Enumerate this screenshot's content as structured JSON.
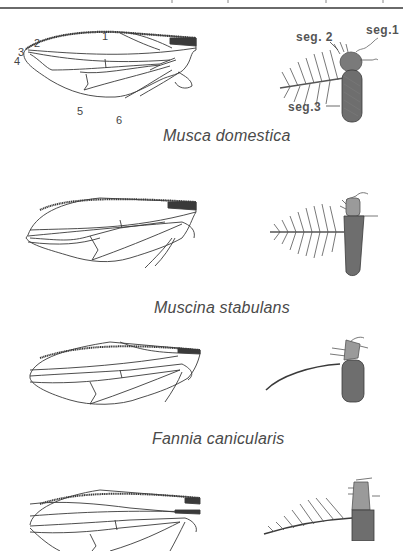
{
  "header": {
    "rule_color": "#6a6a6a"
  },
  "figures": [
    {
      "species": "Musca domestica",
      "wing_labels": [
        "1",
        "2",
        "3",
        "4",
        "5",
        "6"
      ],
      "antenna_labels": {
        "seg1": "seg.1",
        "seg2": "seg. 2",
        "seg3": "seg.3"
      },
      "arista_type": "plumose (feathered both sides)"
    },
    {
      "species": "Muscina stabulans",
      "arista_type": "plumose (feathered both sides)"
    },
    {
      "species": "Fannia canicularis",
      "arista_type": "bare"
    },
    {
      "species": "",
      "arista_type": "pectinate (hairs on upper side)"
    }
  ],
  "colors": {
    "ink": "#3a3a3a",
    "antenna_fill": "#6e6e6e",
    "background": "#ffffff"
  }
}
